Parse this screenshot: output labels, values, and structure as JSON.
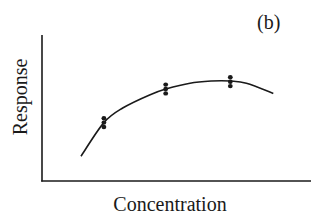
{
  "chart_data": {
    "type": "scatter",
    "title": "",
    "panel_label": "(b)",
    "xlabel": "Concentration",
    "ylabel": "Response",
    "x_ticks": [],
    "y_ticks": [],
    "grid": false,
    "legend": null,
    "xlim": [
      0,
      10
    ],
    "ylim": [
      0,
      10
    ],
    "series": [
      {
        "name": "replicate measurements",
        "kind": "points",
        "x": [
          2.3,
          2.3,
          2.3,
          4.6,
          4.6,
          4.6,
          7.0,
          7.0,
          7.0
        ],
        "y": [
          3.7,
          4.0,
          4.3,
          6.0,
          6.3,
          6.6,
          6.5,
          6.8,
          7.1
        ]
      },
      {
        "name": "fitted curve",
        "kind": "line",
        "x": [
          1.45,
          2.3,
          3.0,
          4.0,
          4.6,
          5.5,
          6.3,
          7.0,
          7.6,
          8.6
        ],
        "y": [
          1.7,
          4.0,
          5.0,
          5.9,
          6.3,
          6.7,
          6.85,
          6.85,
          6.7,
          6.0
        ]
      }
    ],
    "annotations": [
      "Quadratic-like fit with a maximum near x≈6.6; variance roughly constant across concentrations"
    ]
  },
  "labels": {
    "panel": "(b)",
    "x_axis": "Concentration",
    "y_axis": "Response"
  },
  "style": {
    "ink": "#1a1a1a",
    "background": "#ffffff"
  }
}
